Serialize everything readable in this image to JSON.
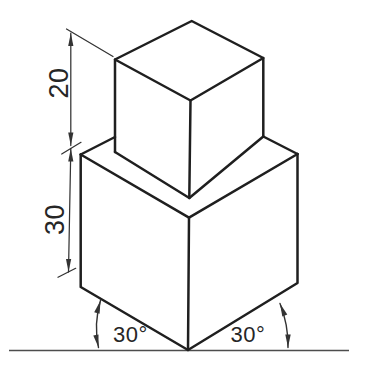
{
  "figure": {
    "type": "isometric-technical-drawing",
    "colors": {
      "background": "#ffffff",
      "line": "#1f1f1f",
      "thin_line": "#333333",
      "ground": "#4d4d4d",
      "text": "#262626"
    },
    "dimensions": [
      {
        "label": "20",
        "orientation": "vertical",
        "target": "upper-block-height"
      },
      {
        "label": "30",
        "orientation": "vertical",
        "target": "lower-block-height"
      }
    ],
    "angles": [
      {
        "label": "30°",
        "side": "left"
      },
      {
        "label": "30°",
        "side": "right"
      }
    ]
  }
}
